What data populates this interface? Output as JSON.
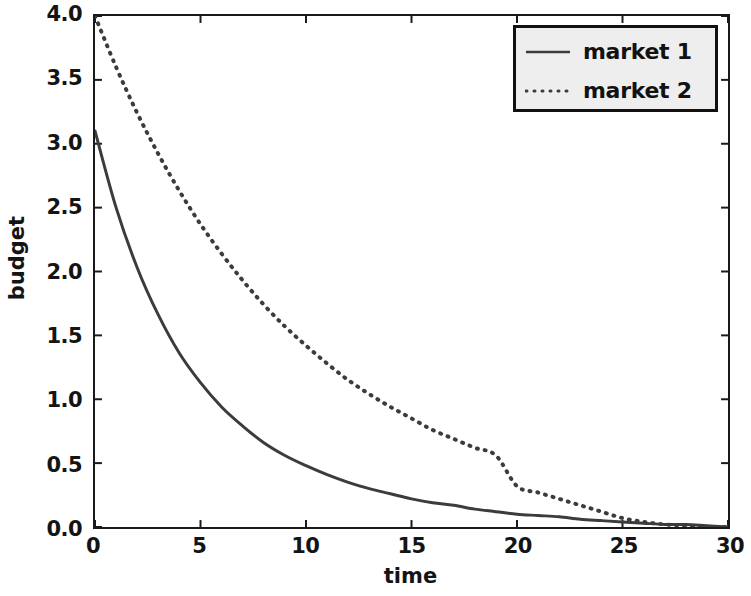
{
  "chart_data": {
    "type": "line",
    "title": "",
    "xlabel": "time",
    "ylabel": "budget",
    "xlim": [
      0,
      30
    ],
    "ylim": [
      0.0,
      4.0
    ],
    "xticks": [
      0,
      5,
      10,
      15,
      20,
      25,
      30
    ],
    "xtick_labels": [
      "0",
      "5",
      "10",
      "15",
      "20",
      "25",
      "30"
    ],
    "yticks": [
      0.0,
      0.5,
      1.0,
      1.5,
      2.0,
      2.5,
      3.0,
      3.5,
      4.0
    ],
    "ytick_labels": [
      "0.0",
      "0.5",
      "1.0",
      "1.5",
      "2.0",
      "2.5",
      "3.0",
      "3.5",
      "4.0"
    ],
    "grid": false,
    "legend_position": "upper right",
    "x": [
      0,
      1,
      2,
      3,
      4,
      5,
      6,
      7,
      8,
      9,
      10,
      11,
      12,
      13,
      14,
      15,
      16,
      17,
      18,
      19,
      20,
      21,
      22,
      23,
      24,
      25,
      26,
      27,
      28,
      29,
      30
    ],
    "series": [
      {
        "name": "market 1",
        "linestyle": "solid",
        "color": "#3c3c3c",
        "values": [
          3.1,
          2.5,
          2.03,
          1.66,
          1.36,
          1.13,
          0.94,
          0.79,
          0.66,
          0.56,
          0.48,
          0.41,
          0.35,
          0.3,
          0.26,
          0.22,
          0.19,
          0.17,
          0.14,
          0.12,
          0.1,
          0.09,
          0.08,
          0.06,
          0.05,
          0.04,
          0.03,
          0.02,
          0.02,
          0.01,
          0.0
        ]
      },
      {
        "name": "market 2",
        "linestyle": "dotted",
        "color": "#3c3c3c",
        "values": [
          4.0,
          3.6,
          3.24,
          2.92,
          2.63,
          2.37,
          2.14,
          1.93,
          1.74,
          1.57,
          1.42,
          1.28,
          1.15,
          1.04,
          0.94,
          0.85,
          0.76,
          0.69,
          0.62,
          0.56,
          0.32,
          0.27,
          0.22,
          0.17,
          0.12,
          0.07,
          0.04,
          0.02,
          0.01,
          0.0,
          0.0
        ]
      }
    ]
  },
  "legend": {
    "entries": [
      {
        "label": "market 1",
        "style": "solid"
      },
      {
        "label": "market 2",
        "style": "dotted"
      }
    ]
  },
  "colors": {
    "background": "#ffffff",
    "axis": "#1a1a1a",
    "line": "#3c3c3c",
    "legend_face": "#eeeeee",
    "legend_edge": "#111111",
    "text": "#141414"
  }
}
